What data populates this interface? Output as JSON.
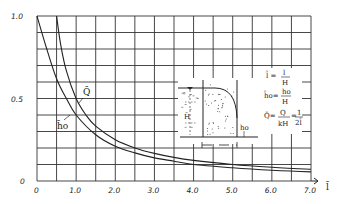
{
  "chart_data": {
    "type": "line",
    "title": "",
    "xlabel": "l̄",
    "ylabel": "",
    "xlim": [
      0,
      7.0
    ],
    "ylim": [
      0,
      1.0
    ],
    "grid": true,
    "x_ticks": [
      "0",
      "1.0",
      "2.0",
      "3.0",
      "4.0",
      "5.0",
      "6.0",
      "7.0"
    ],
    "y_ticks": [
      "0",
      "0.5",
      "1.0"
    ],
    "series": [
      {
        "name": "Q̄",
        "formula": "Q̄ = Q/kH = 1/(2l̄)",
        "x": [
          0.5,
          0.6,
          0.75,
          1.0,
          1.25,
          1.5,
          2.0,
          2.5,
          3.0,
          3.5,
          4.0,
          5.0,
          6.0,
          7.0
        ],
        "values": [
          1.0,
          0.833,
          0.667,
          0.5,
          0.4,
          0.333,
          0.25,
          0.2,
          0.167,
          0.143,
          0.125,
          0.1,
          0.083,
          0.071
        ]
      },
      {
        "name": "h̄o",
        "formula": "h̄o = ho/H",
        "x": [
          0,
          0.25,
          0.5,
          0.75,
          1.0,
          1.5,
          2.0,
          2.5,
          3.0,
          3.5,
          4.0,
          5.0,
          6.0,
          7.0
        ],
        "values": [
          1.0,
          0.8,
          0.62,
          0.5,
          0.4,
          0.28,
          0.21,
          0.17,
          0.14,
          0.12,
          0.1,
          0.08,
          0.065,
          0.055
        ]
      }
    ],
    "annotations": [
      "Q̄",
      "h̄o"
    ],
    "inset": {
      "labels": [
        "H",
        "ho"
      ],
      "definitions": [
        "l̄ = l/H",
        "h̄o = ho/H",
        "Q̄ = Q/kH = 1/2l̄"
      ]
    }
  },
  "labels": {
    "q_curve": "Q̄",
    "h_curve": "h̄o",
    "x_axis": "l̄",
    "inset_H": "H",
    "inset_h0": "ho",
    "def_l_lhs": "l̄ =",
    "def_l_num": "l",
    "def_l_den": "H",
    "def_h_lhs": "h̄o=",
    "def_h_num": "ho",
    "def_h_den": "H",
    "def_q_lhs": "Q̄=",
    "def_q_num": "Q",
    "def_q_den": "kH",
    "def_q_eq": "=",
    "def_q_num2": "1",
    "def_q_den2": "2l̄"
  }
}
